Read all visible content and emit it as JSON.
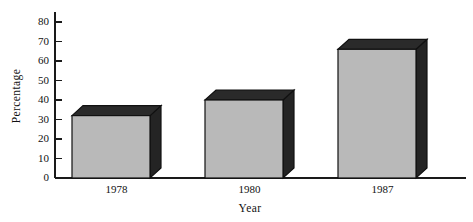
{
  "chart_data": {
    "type": "bar",
    "title": "",
    "subtitle": "",
    "categories": [
      "1978",
      "1980",
      "1987"
    ],
    "values": [
      32,
      40,
      66
    ],
    "series": [
      {
        "name": "Percentage",
        "values": [
          32,
          40,
          66
        ]
      }
    ],
    "xlabel": "Year",
    "ylabel": "Percentage",
    "ylim": [
      0,
      80
    ],
    "yticks": [
      0,
      10,
      20,
      30,
      40,
      50,
      60,
      70,
      80
    ],
    "ytick_labels": [
      "0",
      "10",
      "20",
      "30",
      "40",
      "50",
      "60",
      "70",
      "80"
    ],
    "grid": false,
    "legend": false,
    "legend_position": "none",
    "style": "3d-bar",
    "colors": {
      "bar_front": "#b9b9b9",
      "bar_top": "#2a2a2a",
      "bar_side": "#242424",
      "outline": "#111111",
      "axis": "#1a1a1a",
      "text": "#111111",
      "background": "#ffffff"
    }
  },
  "axes": {
    "y_title": "Percentage",
    "x_title": "Year"
  }
}
